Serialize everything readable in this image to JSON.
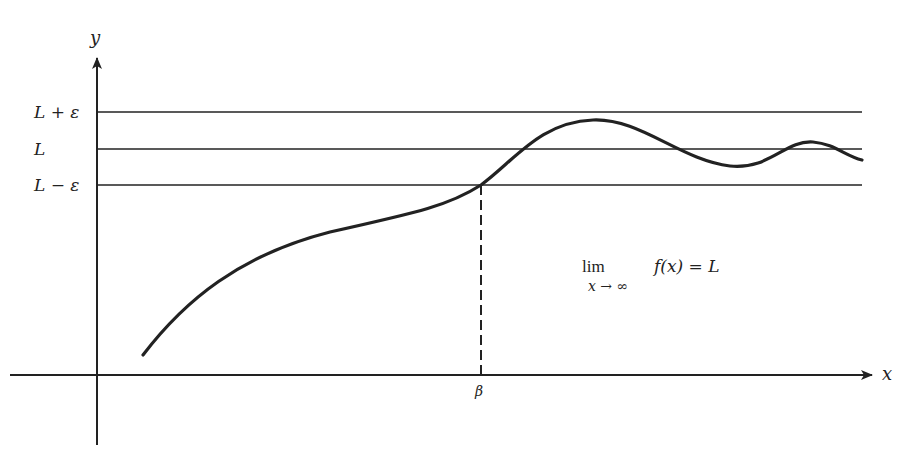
{
  "diagram": {
    "axes": {
      "x_label": "x",
      "y_label": "y",
      "origin": [
        97,
        375
      ],
      "x_axis": {
        "from": 10,
        "to": 872,
        "y": 375
      },
      "y_axis": {
        "from": 445,
        "to": 58,
        "x": 97
      }
    },
    "horizontal_lines": [
      {
        "id": "upper",
        "label": "L + ε",
        "y": 112
      },
      {
        "id": "limit",
        "label": "L",
        "y": 149
      },
      {
        "id": "lower",
        "label": "L − ε",
        "y": 185
      }
    ],
    "beta": {
      "label": "β",
      "x": 481,
      "y_top": 185,
      "y_bottom": 375
    },
    "formula": {
      "lim": "lim",
      "subscript": "x → ∞",
      "expression": "f(x) = L"
    },
    "curve": {
      "description": "f(x): rises from lower-left, crosses L−ε at β, overshoots near L+ε, then oscillates with decreasing amplitude around L",
      "path": "M143,355 C185,300 240,255 330,232 C420,212 450,205 481,185 C515,160 540,122 593,120 C640,118 680,160 730,166 C770,170 785,140 813,142 C835,144 845,156 862,160"
    },
    "colors": {
      "ink": "#222222",
      "background": "#ffffff"
    }
  }
}
